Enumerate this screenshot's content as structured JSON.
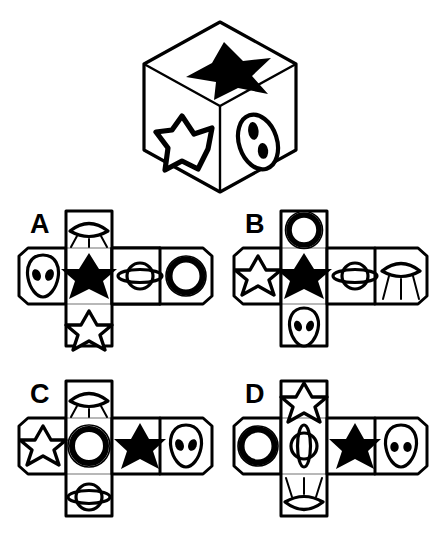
{
  "page": {
    "type": "visual-reasoning-puzzle",
    "description": "Cube unfolding puzzle: a drawn cube with three visible faces above four candidate nets labeled A, B, C, D.",
    "background_color": "#ffffff",
    "ink_color": "#000000"
  },
  "cube": {
    "name": "reference-cube",
    "faces": [
      {
        "position": "top",
        "symbol": "black-star",
        "label": "Black star"
      },
      {
        "position": "left",
        "symbol": "white-star",
        "label": "White outlined star"
      },
      {
        "position": "right",
        "symbol": "alien-face",
        "label": "Alien face"
      }
    ]
  },
  "options": [
    {
      "letter": "A",
      "name": "option-a",
      "cells": [
        {
          "slot": "top",
          "symbol": "ufo",
          "label": "UFO"
        },
        {
          "slot": "left",
          "symbol": "alien-face",
          "label": "Alien face"
        },
        {
          "slot": "center",
          "symbol": "black-star",
          "label": "Black star"
        },
        {
          "slot": "right1",
          "symbol": "saturn",
          "label": "Saturn planet"
        },
        {
          "slot": "right2",
          "symbol": "ring",
          "label": "Ring"
        },
        {
          "slot": "bottom",
          "symbol": "white-star",
          "label": "White outlined star"
        }
      ]
    },
    {
      "letter": "B",
      "name": "option-b",
      "cells": [
        {
          "slot": "top",
          "symbol": "ring",
          "label": "Ring"
        },
        {
          "slot": "left",
          "symbol": "white-star",
          "label": "White outlined star"
        },
        {
          "slot": "center",
          "symbol": "black-star",
          "label": "Black star"
        },
        {
          "slot": "right1",
          "symbol": "saturn",
          "label": "Saturn planet"
        },
        {
          "slot": "right2",
          "symbol": "ufo",
          "label": "UFO"
        },
        {
          "slot": "bottom",
          "symbol": "alien-face",
          "label": "Alien face"
        }
      ]
    },
    {
      "letter": "C",
      "name": "option-c",
      "cells": [
        {
          "slot": "top",
          "symbol": "ufo",
          "label": "UFO"
        },
        {
          "slot": "left",
          "symbol": "white-star",
          "label": "White outlined star"
        },
        {
          "slot": "center",
          "symbol": "ring",
          "label": "Ring"
        },
        {
          "slot": "right1",
          "symbol": "black-star",
          "label": "Black star"
        },
        {
          "slot": "right2",
          "symbol": "alien-face",
          "label": "Alien face"
        },
        {
          "slot": "bottom",
          "symbol": "saturn",
          "label": "Saturn planet"
        }
      ]
    },
    {
      "letter": "D",
      "name": "option-d",
      "cells": [
        {
          "slot": "top",
          "symbol": "white-star",
          "label": "White outlined star"
        },
        {
          "slot": "left",
          "symbol": "ring",
          "label": "Ring"
        },
        {
          "slot": "center",
          "symbol": "saturn-rotated",
          "label": "Saturn planet rotated"
        },
        {
          "slot": "right1",
          "symbol": "black-star",
          "label": "Black star"
        },
        {
          "slot": "right2",
          "symbol": "alien-face",
          "label": "Alien face"
        },
        {
          "slot": "bottom",
          "symbol": "ufo-inverted",
          "label": "UFO inverted"
        }
      ]
    }
  ]
}
